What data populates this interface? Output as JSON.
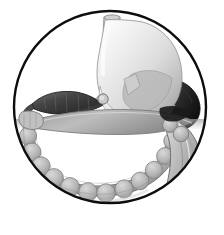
{
  "figure": {
    "title": "Stomach and colon anatomical illustration",
    "caption": "",
    "background_color": "#ffffff",
    "width": 224,
    "height": 235
  },
  "frame": {
    "shape_name": "circle",
    "stroke_color": "#0d0d0d",
    "fill_color": "#ffffff",
    "stroke_width": 2.4,
    "center_x": 110,
    "center_y": 107,
    "radius": 97
  },
  "palette": {
    "outline_dark": "#0d0d0d",
    "organ_outline": "#5a5a5a",
    "stomach_light": "#f1f1f1",
    "stomach_mid": "#d8d8d8",
    "stomach_shadow": "#b4b4b4",
    "esophagus": "#dedede",
    "pancreas_dark": "#3a3a3a",
    "pancreas_mid": "#6e6e6e",
    "spleen_dark": "#1c1c1c",
    "colon_light": "#d2d2d2",
    "colon_mid": "#b0b0b0",
    "colon_shadow": "#8d8d8d",
    "taenia_line": "#6b6b6b",
    "highlight": "#fafafa",
    "shadow_soft": "#9b9b9b"
  },
  "structures": [
    {
      "id": "esophagus",
      "label": "Esophagus",
      "tone": "light-gray",
      "position": "top-center"
    },
    {
      "id": "stomach-fundus",
      "label": "Fundus of stomach",
      "tone": "light-gray",
      "position": "upper-center"
    },
    {
      "id": "stomach-body",
      "label": "Body of stomach",
      "tone": "light-gray-gradient",
      "position": "center"
    },
    {
      "id": "stomach-greater-curvature",
      "label": "Greater curvature",
      "tone": "mid-gray",
      "position": "center-left"
    },
    {
      "id": "spleen",
      "label": "Spleen",
      "tone": "near-black",
      "position": "mid-right"
    },
    {
      "id": "pancreas",
      "label": "Pancreas",
      "tone": "dark-gray",
      "position": "mid-left"
    },
    {
      "id": "transverse-colon",
      "label": "Transverse colon",
      "tone": "mid-gray",
      "position": "center-horizontal"
    },
    {
      "id": "ascending-colon",
      "label": "Ascending colon",
      "tone": "mid-gray",
      "position": "left"
    },
    {
      "id": "descending-colon",
      "label": "Descending colon",
      "tone": "mid-gray",
      "position": "lower-right"
    },
    {
      "id": "haustra",
      "label": "Haustra of colon",
      "tone": "mid-gray",
      "position": "lower-arc"
    },
    {
      "id": "vessel-cross-section",
      "label": "Vessel cross section",
      "tone": "mid-gray",
      "position": "center"
    }
  ],
  "annotations": {
    "labels_visible": false,
    "text_items": []
  }
}
